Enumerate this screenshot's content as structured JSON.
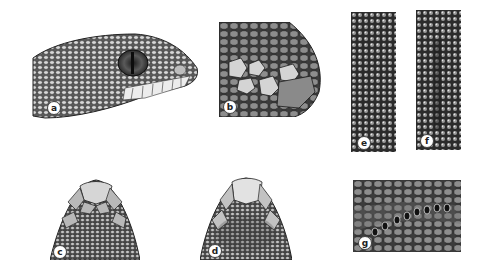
{
  "figure": {
    "background": "#ffffff",
    "ink_color": "#2a2a2a",
    "panels": [
      {
        "id": "a",
        "label": "a",
        "description": "Lateral view of snake head with eye, labial scales"
      },
      {
        "id": "b",
        "label": "b",
        "description": "Close-up of snout scales, lateral"
      },
      {
        "id": "e",
        "label": "e",
        "description": "Dorsal scale texture strip"
      },
      {
        "id": "f",
        "label": "f",
        "description": "Dorsal scale texture strip"
      },
      {
        "id": "c",
        "label": "c",
        "description": "Dorsal view of snout tip scales"
      },
      {
        "id": "d",
        "label": "d",
        "description": "Dorsal view of snout tip scales"
      },
      {
        "id": "g",
        "label": "g",
        "description": "Labial scales with heat-sensing pits"
      }
    ]
  }
}
